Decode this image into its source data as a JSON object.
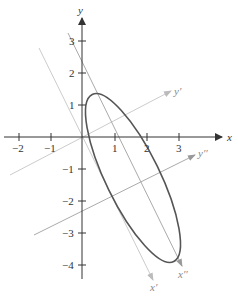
{
  "figure": {
    "axes": {
      "x_label": "x",
      "y_label": "y",
      "x_ticks": [
        "−2",
        "−1",
        "1",
        "2",
        "3"
      ],
      "y_ticks": [
        "3",
        "2",
        "1",
        "−1",
        "−2",
        "−3",
        "−4"
      ]
    },
    "rotated_axes": {
      "x_prime_label": "x′",
      "y_prime_label": "y′",
      "x_double_prime_label": "x′′",
      "y_double_prime_label": "y′′"
    },
    "colors": {
      "axis": "#333333",
      "ellipse": "#555555",
      "prime_axes": "#cccccc",
      "double_prime_axes": "#aaaaaa"
    }
  }
}
